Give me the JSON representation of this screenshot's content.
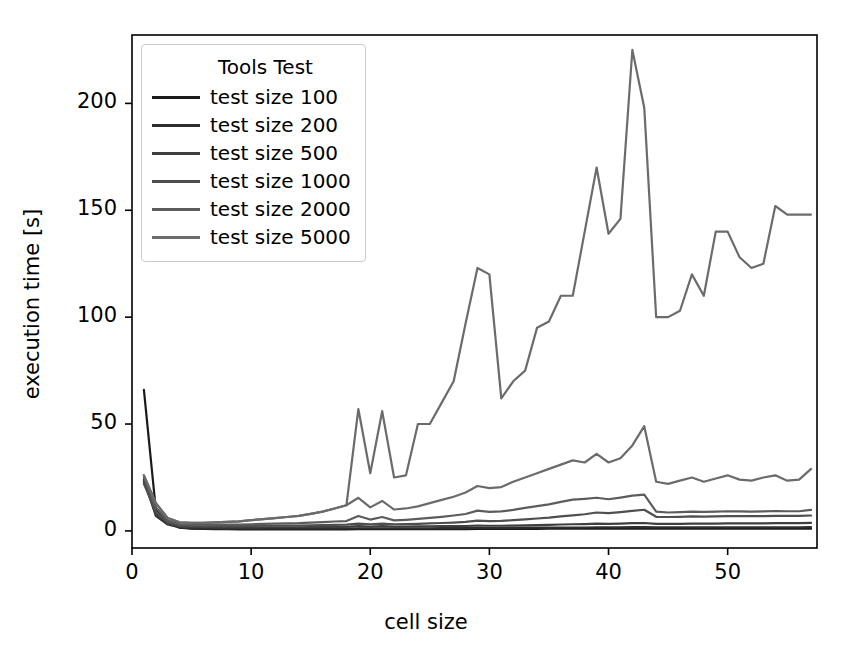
{
  "chart_data": {
    "type": "line",
    "title": "",
    "xlabel": "cell size",
    "ylabel": "execution time [s]",
    "xlim": [
      0,
      57.5
    ],
    "ylim": [
      -8,
      232
    ],
    "xticks": [
      0,
      10,
      20,
      30,
      40,
      50
    ],
    "yticks": [
      0,
      50,
      100,
      150,
      200
    ],
    "grid": false,
    "legend": {
      "title": "Tools Test",
      "position": "upper-left",
      "entries": [
        "test size 100",
        "test size 200",
        "test size 500",
        "test size 1000",
        "test size 2000",
        "test size 5000"
      ]
    },
    "colors": [
      "#1a1a1a",
      "#2e2e2e",
      "#3f3f3f",
      "#4f4f4f",
      "#5c5c5c",
      "#6b6b6b"
    ],
    "x": [
      1,
      2,
      3,
      4,
      5,
      6,
      7,
      8,
      9,
      10,
      11,
      12,
      13,
      14,
      15,
      16,
      17,
      18,
      19,
      20,
      21,
      22,
      23,
      24,
      25,
      26,
      27,
      28,
      29,
      30,
      31,
      32,
      33,
      34,
      35,
      36,
      37,
      38,
      39,
      40,
      41,
      42,
      43,
      44,
      45,
      46,
      47,
      48,
      49,
      50,
      51,
      52,
      53,
      54,
      55,
      56,
      57
    ],
    "series": [
      {
        "name": "test size 100",
        "values": [
          66,
          10,
          4,
          1.5,
          1.0,
          0.9,
          0.8,
          0.8,
          0.7,
          0.7,
          0.7,
          0.7,
          0.7,
          0.7,
          0.7,
          0.7,
          0.7,
          0.7,
          0.8,
          0.8,
          0.8,
          0.8,
          0.8,
          0.8,
          0.8,
          0.8,
          0.8,
          0.8,
          0.9,
          0.9,
          0.9,
          0.9,
          0.9,
          0.9,
          1.0,
          1.0,
          1.0,
          1.0,
          1.0,
          1.0,
          1.0,
          1.1,
          1.1,
          1.0,
          1.0,
          1.0,
          1.0,
          1.0,
          1.0,
          1.0,
          1.0,
          1.0,
          1.0,
          1.0,
          1.0,
          1.0,
          1.0
        ]
      },
      {
        "name": "test size 200",
        "values": [
          24,
          7,
          3,
          1.6,
          1.2,
          1.1,
          1.0,
          1.0,
          1.0,
          1.0,
          1.0,
          1.0,
          1.0,
          1.0,
          1.0,
          1.1,
          1.1,
          1.1,
          1.2,
          1.2,
          1.2,
          1.2,
          1.2,
          1.2,
          1.2,
          1.3,
          1.3,
          1.3,
          1.4,
          1.4,
          1.4,
          1.4,
          1.5,
          1.5,
          1.5,
          1.6,
          1.6,
          1.6,
          1.7,
          1.7,
          1.7,
          1.8,
          1.8,
          1.7,
          1.7,
          1.7,
          1.7,
          1.7,
          1.7,
          1.7,
          1.7,
          1.7,
          1.7,
          1.7,
          1.7,
          1.7,
          1.8
        ]
      },
      {
        "name": "test size 500",
        "values": [
          23,
          8,
          3.5,
          2.0,
          1.8,
          1.7,
          1.6,
          1.6,
          1.6,
          1.6,
          1.7,
          1.7,
          1.7,
          1.7,
          1.8,
          1.8,
          1.9,
          1.9,
          2.2,
          2.0,
          2.2,
          2.0,
          2.0,
          2.1,
          2.1,
          2.2,
          2.2,
          2.3,
          2.5,
          2.4,
          2.4,
          2.5,
          2.6,
          2.7,
          2.8,
          3.0,
          3.1,
          3.2,
          3.4,
          3.3,
          3.4,
          3.6,
          3.7,
          3.3,
          3.3,
          3.3,
          3.4,
          3.4,
          3.4,
          3.5,
          3.5,
          3.5,
          3.5,
          3.6,
          3.6,
          3.6,
          3.8
        ]
      },
      {
        "name": "test size 1000",
        "values": [
          22,
          9,
          4.0,
          2.6,
          2.3,
          2.2,
          2.2,
          2.2,
          2.2,
          2.3,
          2.4,
          2.4,
          2.5,
          2.5,
          2.6,
          2.7,
          2.8,
          2.9,
          3.4,
          3.1,
          3.4,
          3.1,
          3.2,
          3.3,
          3.5,
          3.7,
          3.9,
          4.2,
          4.8,
          4.6,
          4.7,
          5.0,
          5.4,
          5.8,
          6.2,
          6.8,
          7.3,
          7.8,
          8.6,
          8.3,
          8.8,
          9.4,
          9.9,
          6.6,
          6.5,
          6.6,
          6.8,
          6.7,
          6.8,
          6.9,
          6.9,
          6.9,
          6.9,
          7.0,
          7.0,
          7.0,
          7.2
        ]
      },
      {
        "name": "test size 2000",
        "values": [
          25,
          11,
          5.0,
          3.2,
          2.9,
          2.8,
          2.9,
          2.9,
          3.0,
          3.1,
          3.3,
          3.4,
          3.5,
          3.6,
          3.9,
          4.1,
          4.4,
          4.6,
          7.0,
          5.3,
          6.5,
          4.9,
          5.2,
          5.6,
          6.1,
          6.6,
          7.2,
          7.9,
          9.5,
          8.9,
          9.1,
          9.8,
          10.8,
          11.6,
          12.4,
          13.6,
          14.6,
          15.0,
          15.5,
          14.8,
          15.6,
          16.5,
          17.0,
          9.0,
          8.6,
          8.8,
          9.0,
          8.9,
          9.0,
          9.2,
          9.1,
          9.0,
          9.1,
          9.3,
          9.2,
          9.2,
          9.8
        ]
      },
      {
        "name": "test size 5000",
        "values": [
          26,
          13,
          6.0,
          4.0,
          3.8,
          3.8,
          4.0,
          4.2,
          4.5,
          5.0,
          5.5,
          6.0,
          6.5,
          7.0,
          8.0,
          9.0,
          10.5,
          12.0,
          15.5,
          11.0,
          14.0,
          10.0,
          10.5,
          11.5,
          13.0,
          14.5,
          16.0,
          18.0,
          21.0,
          20.0,
          20.5,
          23.0,
          25.0,
          27.0,
          29.0,
          31.0,
          33.0,
          32.0,
          36.0,
          32.0,
          34.0,
          40.0,
          49.0,
          23.0,
          22.0,
          23.5,
          25.0,
          23.0,
          24.5,
          26.0,
          24.0,
          23.5,
          25.0,
          26.0,
          23.5,
          24.0,
          29.0
        ]
      }
    ],
    "series_tall": {
      "name": "test size 5000 (upper trace)",
      "x": [
        1,
        2,
        3,
        4,
        5,
        6,
        7,
        8,
        9,
        10,
        11,
        12,
        13,
        14,
        15,
        16,
        17,
        18,
        19,
        20,
        21,
        22,
        23,
        24,
        25,
        26,
        27,
        28,
        29,
        30,
        31,
        32,
        33,
        34,
        35,
        36,
        37,
        38,
        39,
        40,
        41,
        42,
        43,
        44,
        45,
        46,
        47,
        48,
        49,
        50,
        51,
        52,
        53,
        54,
        55,
        56,
        57
      ],
      "values": [
        26,
        13,
        6,
        4,
        3.8,
        3.8,
        4,
        4.2,
        4.5,
        5,
        5.5,
        6,
        6.5,
        7,
        8,
        9,
        10.5,
        12,
        57,
        27,
        56,
        25,
        26,
        50,
        50,
        60,
        70,
        97,
        123,
        120,
        62,
        70,
        75,
        95,
        98,
        110,
        110,
        140,
        170,
        139,
        146,
        225,
        198,
        100,
        100,
        103,
        120,
        110,
        140,
        140,
        128,
        123,
        125,
        152,
        148,
        148,
        148
      ]
    }
  }
}
